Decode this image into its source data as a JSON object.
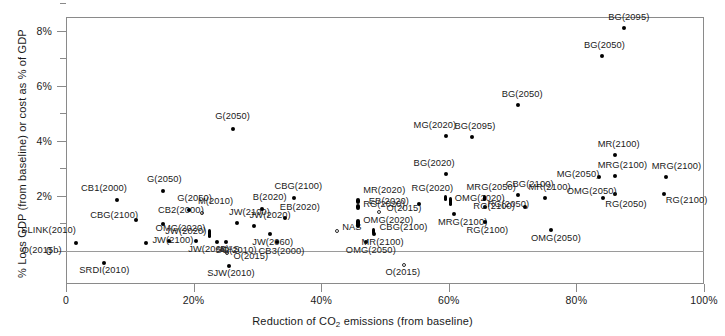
{
  "chart_data": {
    "type": "scatter",
    "title": "",
    "xlabel": "Reduction of CO2 emissions (from baseline)",
    "xlabel_parts": {
      "pre": "Reduction of CO",
      "sub": "2",
      "post": " emissions (from baseline)"
    },
    "ylabel": "% Loss GDP (from baseline) or cost as % of GDP",
    "xlim": [
      0,
      100
    ],
    "ylim": [
      -1.1,
      9.2
    ],
    "grid": false,
    "legend": null,
    "x_ticks": [
      {
        "value": 0,
        "label": "0"
      },
      {
        "value": 20,
        "label": "20%"
      },
      {
        "value": 40,
        "label": "40%"
      },
      {
        "value": 60,
        "label": "60%"
      },
      {
        "value": 80,
        "label": "80%"
      },
      {
        "value": 100,
        "label": "100%"
      }
    ],
    "y_ticks": [
      {
        "value": 0,
        "label": "0",
        "minor": false
      },
      {
        "value": 1,
        "label": "",
        "minor": true
      },
      {
        "value": 2,
        "label": "2%",
        "minor": false
      },
      {
        "value": 3,
        "label": "",
        "minor": true
      },
      {
        "value": 4,
        "label": "4%",
        "minor": false
      },
      {
        "value": 5,
        "label": "",
        "minor": true
      },
      {
        "value": 6,
        "label": "6%",
        "minor": false
      },
      {
        "value": 7,
        "label": "",
        "minor": true
      },
      {
        "value": 8,
        "label": "8%",
        "minor": false
      },
      {
        "value": 9,
        "label": "",
        "minor": true
      }
    ],
    "marker_styles": {
      "filled": "#000000",
      "open": "#2b2b2b"
    },
    "points": [
      {
        "label": "SLINK(2010)",
        "x": 1.6,
        "y": 0.3,
        "style": "filled",
        "lx": -55,
        "ly": -13
      },
      {
        "label": "SRDI(2010)",
        "x": 6.0,
        "y": -0.45,
        "style": "filled",
        "lx": -25,
        "ly": 7
      },
      {
        "label": "CB1(2000)",
        "x": 8.0,
        "y": 1.85,
        "style": "filled",
        "lx": -36,
        "ly": -12
      },
      {
        "label": "CBG(2100)",
        "x": 11.0,
        "y": 1.12,
        "style": "filled",
        "lx": -46,
        "ly": -5
      },
      {
        "label": "JW(2100)",
        "x": 12.6,
        "y": 0.3,
        "style": "filled",
        "lx": 6,
        "ly": -3
      },
      {
        "label": "CB2(2000)",
        "x": 15.2,
        "y": 0.98,
        "style": "filled",
        "lx": -5,
        "ly": -14
      },
      {
        "label": "G(2050)",
        "x": 15.2,
        "y": 2.18,
        "style": "filled",
        "lx": -16,
        "ly": -12
      },
      {
        "label": "JW(2020)",
        "x": 16.2,
        "y": 0.38,
        "style": "filled",
        "lx": -4,
        "ly": -10
      },
      {
        "label": "G(2050)",
        "x": 19.3,
        "y": 1.5,
        "style": "filled",
        "lx": -12,
        "ly": -12
      },
      {
        "label": "JW(2060)",
        "x": 20.4,
        "y": 0.36,
        "style": "filled",
        "lx": -8,
        "ly": 8
      },
      {
        "label": "M(2010)",
        "x": 21.3,
        "y": 1.38,
        "style": "open",
        "lx": -4,
        "ly": -12
      },
      {
        "label": "OMG(2020)",
        "x": 22.5,
        "y": 0.65,
        "style": "tall",
        "lx": -54,
        "ly": -5
      },
      {
        "label": "NAS",
        "x": 23.7,
        "y": 0.34,
        "style": "filled",
        "lx": 3,
        "ly": 7
      },
      {
        "label": "SG(2010)",
        "x": 25.0,
        "y": 0.34,
        "style": "filled",
        "lx": -10,
        "ly": 8
      },
      {
        "label": "O(2015)",
        "x": 25.3,
        "y": -0.07,
        "style": "open",
        "lx": 6,
        "ly": 3
      },
      {
        "label": "O(2015b)",
        "x": 24.4,
        "y": 0.05,
        "style": "open",
        "lx": -200,
        "ly": 0
      },
      {
        "label": "SJW(2010)",
        "x": 25.6,
        "y": -0.55,
        "style": "filled",
        "lx": -22,
        "ly": 7
      },
      {
        "label": "G(2050)",
        "x": 26.2,
        "y": 4.42,
        "style": "filled",
        "lx": -18,
        "ly": -13
      },
      {
        "label": "JW(2100)",
        "x": 26.8,
        "y": 1.02,
        "style": "filled",
        "lx": -8,
        "ly": -11
      },
      {
        "label": "JW(2020)",
        "x": 29.4,
        "y": 0.92,
        "style": "filled",
        "lx": -4,
        "ly": -11
      },
      {
        "label": "B(2020)",
        "x": 30.7,
        "y": 1.52,
        "style": "filled",
        "lx": -9,
        "ly": -12
      },
      {
        "label": "JW(2060)",
        "x": 32.0,
        "y": 0.62,
        "style": "filled",
        "lx": -18,
        "ly": 8
      },
      {
        "label": "CB3(2000)",
        "x": 33.0,
        "y": 0.33,
        "style": "filled",
        "lx": -18,
        "ly": 9
      },
      {
        "label": "EB(2020)",
        "x": 34.3,
        "y": 1.18,
        "style": "filled",
        "lx": -5,
        "ly": -11
      },
      {
        "label": "CBG(2100)",
        "x": 35.8,
        "y": 1.92,
        "style": "filled",
        "lx": -20,
        "ly": -12
      },
      {
        "label": "NAS",
        "x": 42.5,
        "y": 0.72,
        "style": "open",
        "lx": 5,
        "ly": -4
      },
      {
        "label": "MR(2020)",
        "x": 45.8,
        "y": 1.82,
        "style": "tall2",
        "lx": 5,
        "ly": -11
      },
      {
        "label": "RG(2020)",
        "x": 45.8,
        "y": 1.58,
        "style": "tall2",
        "lx": 5,
        "ly": -3
      },
      {
        "label": "OMG(2020)",
        "x": 45.8,
        "y": 0.98,
        "style": "tall",
        "lx": 5,
        "ly": -4
      },
      {
        "label": "OMG(2050)",
        "x": 47.0,
        "y": 0.33,
        "style": "filled",
        "lx": -20,
        "ly": 8
      },
      {
        "label": "CBG(2100)",
        "x": 48.2,
        "y": 0.72,
        "style": "tall2",
        "lx": 6,
        "ly": -4
      },
      {
        "label": "MR(2100)",
        "x": 48.2,
        "y": 0.62,
        "style": "filled",
        "lx": -12,
        "ly": 8
      },
      {
        "label": "O(2015)",
        "x": 49.0,
        "y": 1.42,
        "style": "open",
        "lx": 8,
        "ly": -4
      },
      {
        "label": "O(2015)",
        "x": 52.9,
        "y": -0.52,
        "style": "open",
        "lx": -18,
        "ly": 7
      },
      {
        "label": "EB(2020)",
        "x": 55.3,
        "y": 1.72,
        "style": "filled",
        "lx": -50,
        "ly": -3
      },
      {
        "label": "MG(2020)",
        "x": 59.5,
        "y": 4.18,
        "style": "filled",
        "lx": -32,
        "ly": -11
      },
      {
        "label": "BG(2020)",
        "x": 59.5,
        "y": 2.78,
        "style": "filled",
        "lx": -32,
        "ly": -11
      },
      {
        "label": "RG(2020)",
        "x": 59.5,
        "y": 1.92,
        "style": "tall2",
        "lx": -34,
        "ly": -10
      },
      {
        "label": "OMG(2020)",
        "x": 60.3,
        "y": 1.78,
        "style": "tall",
        "lx": 4,
        "ly": -4
      },
      {
        "label": "MRG(2100)",
        "x": 60.8,
        "y": 1.35,
        "style": "filled",
        "lx": -16,
        "ly": 8
      },
      {
        "label": "BG(2095)",
        "x": 63.7,
        "y": 4.15,
        "style": "filled",
        "lx": -18,
        "ly": -11
      },
      {
        "label": "MRG(2050)",
        "x": 65.6,
        "y": 1.92,
        "style": "tall2",
        "lx": -18,
        "ly": -11
      },
      {
        "label": "RG(2050)",
        "x": 65.6,
        "y": 1.6,
        "style": "filled",
        "lx": 3,
        "ly": -3
      },
      {
        "label": "RG(2100)",
        "x": 65.6,
        "y": 1.05,
        "style": "filled",
        "lx": -18,
        "ly": 8
      },
      {
        "label": "CBG(2100)",
        "x": 70.8,
        "y": 2.02,
        "style": "filled",
        "lx": -12,
        "ly": -11
      },
      {
        "label": "BG(2050)",
        "x": 70.8,
        "y": 5.28,
        "style": "filled",
        "lx": -16,
        "ly": -11
      },
      {
        "label": "RG(2100)",
        "x": 72.0,
        "y": 1.6,
        "style": "filled",
        "lx": -52,
        "ly": -1
      },
      {
        "label": "MR(2100)",
        "x": 75.0,
        "y": 1.92,
        "style": "filled",
        "lx": -16,
        "ly": -11
      },
      {
        "label": "OMG(2050)",
        "x": 76.0,
        "y": 0.78,
        "style": "filled",
        "lx": -20,
        "ly": 8
      },
      {
        "label": "MR(2100)",
        "x": 86.0,
        "y": 3.5,
        "style": "filled",
        "lx": -17,
        "ly": -11
      },
      {
        "label": "MG(2050)",
        "x": 83.5,
        "y": 2.68,
        "style": "filled",
        "lx": -42,
        "ly": -3
      },
      {
        "label": "MRG(2100)",
        "x": 86.0,
        "y": 2.72,
        "style": "filled",
        "lx": -17,
        "ly": -11
      },
      {
        "label": "OMG(2050)",
        "x": 86.0,
        "y": 2.05,
        "style": "filled",
        "lx": -48,
        "ly": -3
      },
      {
        "label": "RG(2050)",
        "x": 84.2,
        "y": 1.92,
        "style": "filled",
        "lx": 2,
        "ly": 6
      },
      {
        "label": "BG(2050)",
        "x": 84.0,
        "y": 7.08,
        "style": "filled",
        "lx": -18,
        "ly": -11
      },
      {
        "label": "BG(2095)",
        "x": 87.5,
        "y": 8.1,
        "style": "filled",
        "lx": -16,
        "ly": -11
      },
      {
        "label": "MRG(2100)",
        "x": 94.0,
        "y": 2.68,
        "style": "filled",
        "lx": -14,
        "ly": -11
      },
      {
        "label": "RG(2100)",
        "x": 93.7,
        "y": 2.05,
        "style": "filled",
        "lx": 2,
        "ly": 6
      }
    ]
  }
}
